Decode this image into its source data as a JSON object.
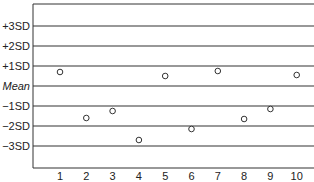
{
  "chart_data": {
    "type": "scatter",
    "title": "",
    "xlabel": "",
    "ylabel": "",
    "x": [
      1,
      2,
      3,
      4,
      5,
      6,
      7,
      8,
      9,
      10
    ],
    "series": [
      {
        "name": "observations",
        "marker": "open-circle",
        "values": [
          0.7,
          -1.6,
          -1.25,
          -2.7,
          0.5,
          -2.15,
          0.75,
          -1.65,
          -1.15,
          0.55
        ]
      }
    ],
    "y_reference_lines": [
      {
        "label": "+3SD",
        "value": 3
      },
      {
        "label": "+2SD",
        "value": 2
      },
      {
        "label": "+1SD",
        "value": 1
      },
      {
        "label": "Mean",
        "value": 0,
        "italic": true
      },
      {
        "label": "−1SD",
        "value": -1
      },
      {
        "label": "−2SD",
        "value": -2
      },
      {
        "label": "−3SD",
        "value": -3
      }
    ],
    "x_tick_labels": [
      "1",
      "2",
      "3",
      "4",
      "5",
      "6",
      "7",
      "8",
      "9",
      "10"
    ],
    "ylim": [
      -4.1,
      4.15
    ],
    "xlim": [
      0.05,
      10.7
    ],
    "grid": false,
    "legend": "none",
    "colors": {
      "line": "#333333",
      "marker_stroke": "#333333",
      "text": "#222222"
    }
  }
}
